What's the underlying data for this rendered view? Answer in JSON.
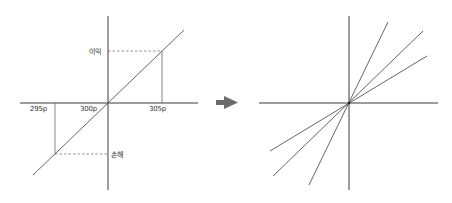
{
  "left_diagram": {
    "labels": {
      "profit": "이익",
      "loss": "손해",
      "price_low": "295p",
      "price_mid": "300p",
      "price_high": "305p"
    }
  },
  "arrow": {
    "icon": "right-arrow-icon",
    "color": "#6b6b6b"
  },
  "right_diagram": {
    "line_count": 3
  },
  "colors": {
    "axis": "#3a3a3a",
    "line": "#555555",
    "dash": "#666666"
  }
}
